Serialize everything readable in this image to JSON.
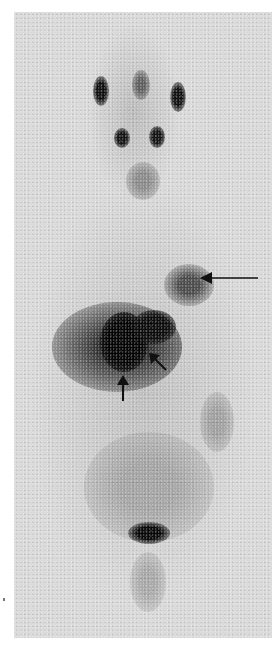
{
  "image": {
    "modality": "whole-body scintigraphy (anterior view)",
    "background_color": "#ffffff",
    "panel_color": "#dadada",
    "hotspot_color": "#111111"
  },
  "annotations": [
    {
      "type": "long-arrow",
      "direction": "left",
      "points_to": "focal uptake upper-left abdomen/chest region",
      "x": 256,
      "y": 278
    },
    {
      "type": "short-arrow",
      "direction": "up",
      "points_to": "intense central uptake",
      "x": 122,
      "y": 380
    },
    {
      "type": "short-arrow",
      "direction": "up-left",
      "points_to": "intense uptake margin",
      "x": 157,
      "y": 355
    }
  ],
  "structures": [
    "head with paired salivary/parotid uptake",
    "submandibular uptake",
    "thyroid region",
    "liver/spleen region with intense uptake",
    "bladder"
  ]
}
